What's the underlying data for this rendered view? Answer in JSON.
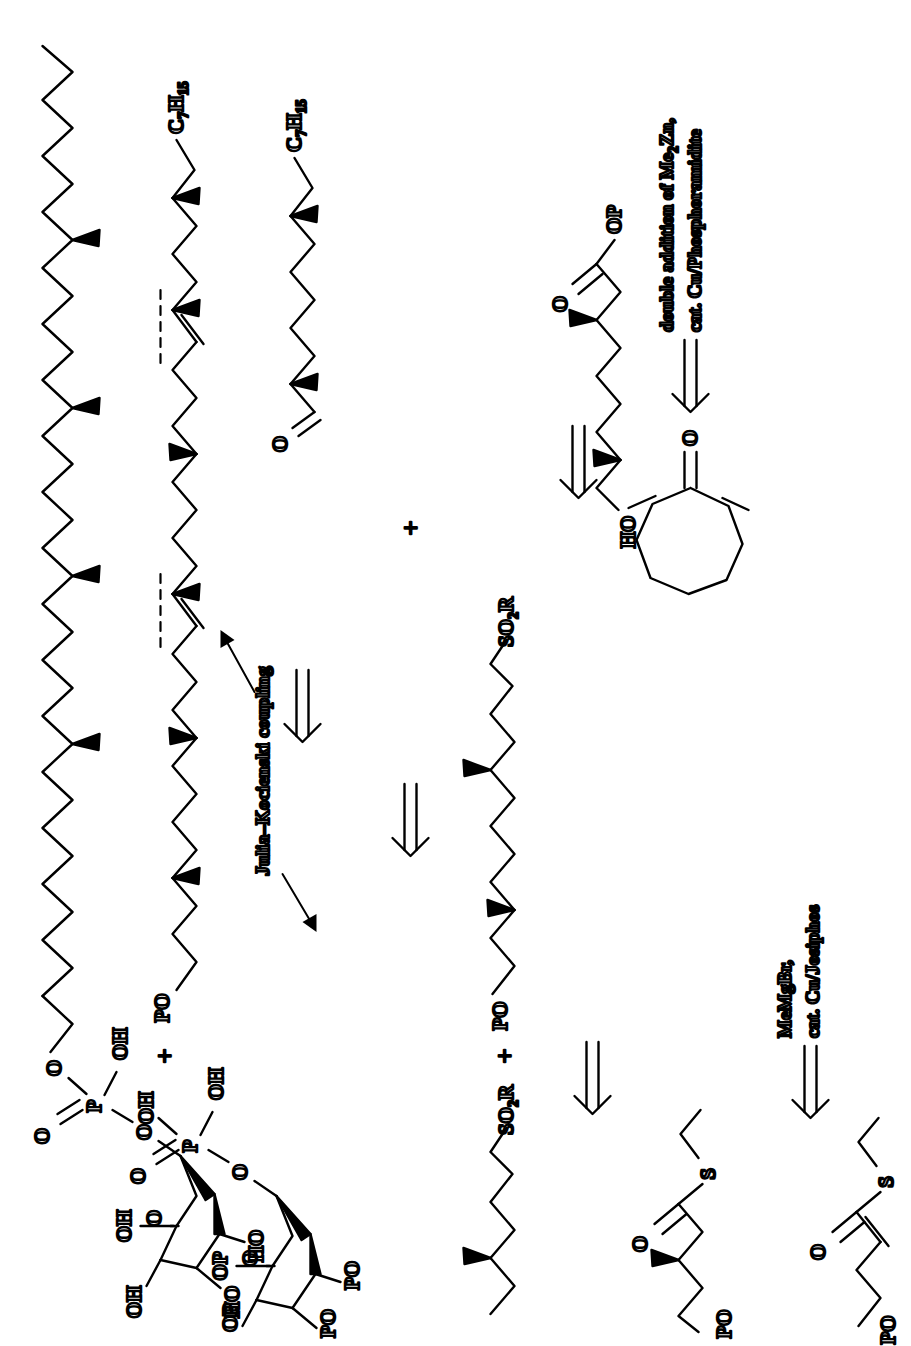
{
  "figure": {
    "kind": "retrosynthesis-scheme",
    "orientation": "rotated-90-ccw",
    "background": "#ffffff",
    "ink": "#000000"
  },
  "annotations": {
    "julia_kocienski": "Julia–Kocienski coupling",
    "double_addition_line1": "double addition of Me",
    "double_addition_sub": "2",
    "double_addition_line1_tail": "Zn,",
    "double_addition_line2": "cat. Cu/Phosphoramidite",
    "memgbr_line1": "MeMgBr,",
    "memgbr_line2": "cat. Cu/Josiphos"
  },
  "operators": {
    "plus": "+",
    "retro_arrow": "double-line-open-arrow"
  },
  "structures": [
    {
      "id": "target-phosphoglycolipid",
      "name": "target glycolipid phosphate",
      "labels": [
        "O",
        "P",
        "OH",
        "O",
        "O",
        "OH",
        "OH",
        "HO",
        "HO",
        "O"
      ],
      "features": "long polymethylated chain with 4 wedge methyls, phosphate diester, pyranose ring with free OH groups"
    },
    {
      "id": "diene-phosphate-protected",
      "name": "bis-alkene protected glycolipid phosphate",
      "labels": [
        "C",
        "7",
        "H",
        "15",
        "O",
        "P",
        "OH",
        "OH",
        "O",
        "O",
        "OP",
        "OP",
        "PO",
        "PO",
        "O"
      ],
      "features": "chain containing two E-alkenes marked by dashed disconnection lines, protected pyranose"
    },
    {
      "id": "aldehyde-fragment",
      "name": "methyl-branched aldehyde bearing heptyl chain",
      "labels": [
        "C",
        "7",
        "H",
        "15",
        "O"
      ]
    },
    {
      "id": "sulfone-fragment-upper",
      "name": "Julia–Kocienski sulfone fragment",
      "labels": [
        "SO",
        "2",
        "R",
        "PO"
      ]
    },
    {
      "id": "sulfone-fragment-lower",
      "name": "second Julia–Kocienski sulfone fragment",
      "labels": [
        "SO",
        "2",
        "R",
        "PO"
      ]
    },
    {
      "id": "hydroxy-ester",
      "name": "hydroxy ester OP fragment",
      "labels": [
        "O",
        "OP",
        "HO"
      ]
    },
    {
      "id": "cyclooctadienone",
      "name": "cycloocta-2,7-dien-1-one",
      "labels": [
        "O"
      ]
    },
    {
      "id": "thioester-saturated",
      "name": "β-methyl thioester",
      "labels": [
        "O",
        "S",
        "PO"
      ]
    },
    {
      "id": "thioester-enone",
      "name": "α,β-unsaturated thioester",
      "labels": [
        "O",
        "S",
        "PO"
      ]
    }
  ],
  "atom_labels": {
    "O": "O",
    "P": "P",
    "S": "S",
    "OH": "OH",
    "HO": "HO",
    "OP": "OP",
    "PO": "PO",
    "SO2R_main": "SO",
    "SO2R_sub": "2",
    "SO2R_tail": "R",
    "C7H15_C": "C",
    "C7H15_sub1": "7",
    "C7H15_H": "H",
    "C7H15_sub2": "15"
  }
}
